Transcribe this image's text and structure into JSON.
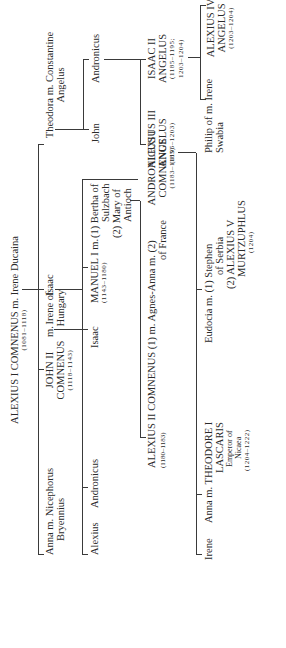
{
  "root": {
    "name": "ALEXIUS I COMNENUS m. Irene Ducaina",
    "dates": "(1081–1118)"
  },
  "gen2": {
    "anna": {
      "l1": "Anna m. Nicephorus",
      "l2": "Bryennius"
    },
    "john2": {
      "l1": "JOHN II",
      "l2": "COMNENUS",
      "dates": "(1118–1143)"
    },
    "john2_m": "m.",
    "irene_hungary": {
      "l1": "Irene of",
      "l2": "Hungary"
    },
    "isaac": "Isaac",
    "theodora": {
      "l1": "Theodora m. Constantine",
      "l2": "Angelus"
    }
  },
  "gen3": {
    "alexius": "Alexius",
    "andronicus": "Andronicus",
    "isaac": "Isaac",
    "manuel": {
      "l1": "MANUEL I m.",
      "dates": "(1143–1180)"
    },
    "manuel_wives": {
      "w1_num": "(1)",
      "w1_l1": "Bertha of",
      "w1_l2": "Sulzbach",
      "w2_num": "(2)",
      "w2_l1": "Mary of",
      "w2_l2": "Antioch"
    },
    "andronicus1": {
      "l1": "ANDRONICUS I",
      "l2": "COMNENUS",
      "dates": "(1183–1185)"
    },
    "john": "John",
    "andronicus_ang": "Andronicus"
  },
  "gen4": {
    "alexius2": {
      "l1": "ALEXIUS II COMNENUS (1) m. Agnes-Anna m. (2)",
      "dates": "(1180–1183)",
      "l2": "of France"
    },
    "alexius3": {
      "l1": "ALEXIUS III",
      "l2": "ANGELUS",
      "dates": "(1195–1203)"
    },
    "isaac2": {
      "l1": "ISAAC II",
      "l2": "ANGELUS",
      "dates1": "(1185–1195;",
      "dates2": "1203–1204)"
    }
  },
  "gen5": {
    "irene": "Irene",
    "anna_lascaris": {
      "l1": "Anna m. THEODORE I",
      "l2": "LASCARIS",
      "s1": "Emperor of",
      "s2": "Nicaea",
      "dates": "(1204–1222)"
    },
    "eudocia": {
      "l1": "Eudocia m. (1) Stephen",
      "l2": "of Serbia",
      "l3": "(2) ALEXIUS V",
      "l4": "MURTZUPHLUS",
      "dates": "(1204)"
    },
    "philip": {
      "l1": "Philip of m. Irene",
      "l2": "Swabia"
    },
    "alexius4": {
      "l1": "ALEXIUS IV",
      "l2": "ANGELUS",
      "dates": "(1203–1204)"
    }
  }
}
